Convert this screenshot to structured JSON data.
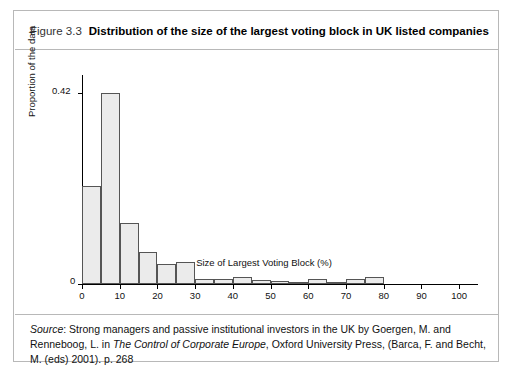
{
  "figure": {
    "number": "Figure 3.3",
    "title": "Distribution of the size of the largest voting block in UK listed companies"
  },
  "source": {
    "label": "Source",
    "line1_a": ": Strong managers and passive institutional investors in the UK by Goergen, M. and Renneboog, L. in",
    "line2_italic": "The Control of Corporate Europe",
    "line2_rest": ", Oxford University Press, (Barca, F. and Becht, M. (eds) 2001). p. 268"
  },
  "chart_data": {
    "type": "bar",
    "title": "Distribution of the size of the largest voting block in UK listed companies",
    "xlabel": "Size of Largest Voting Block (%)",
    "ylabel": "Proportion of the data",
    "xlim": [
      0,
      105
    ],
    "ylim": [
      0,
      0.46
    ],
    "grid": false,
    "legend": null,
    "xticks": [
      "0",
      "10",
      "20",
      "30",
      "40",
      "50",
      "60",
      "70",
      "80",
      "90",
      "100"
    ],
    "xtick_values": [
      0,
      10,
      20,
      30,
      40,
      50,
      60,
      70,
      80,
      90,
      100
    ],
    "yticks": [
      "0",
      "0.42"
    ],
    "ytick_values": [
      0,
      0.42
    ],
    "bin_width": 5,
    "bins": [
      {
        "x0": 0,
        "x1": 5,
        "value": 0.215
      },
      {
        "x0": 5,
        "x1": 10,
        "value": 0.42
      },
      {
        "x0": 10,
        "x1": 15,
        "value": 0.135
      },
      {
        "x0": 15,
        "x1": 20,
        "value": 0.07
      },
      {
        "x0": 20,
        "x1": 25,
        "value": 0.043
      },
      {
        "x0": 25,
        "x1": 30,
        "value": 0.048
      },
      {
        "x0": 30,
        "x1": 35,
        "value": 0.012
      },
      {
        "x0": 35,
        "x1": 40,
        "value": 0.012
      },
      {
        "x0": 40,
        "x1": 45,
        "value": 0.016
      },
      {
        "x0": 45,
        "x1": 50,
        "value": 0.008
      },
      {
        "x0": 50,
        "x1": 55,
        "value": 0.006
      },
      {
        "x0": 55,
        "x1": 60,
        "value": 0.004
      },
      {
        "x0": 60,
        "x1": 65,
        "value": 0.01
      },
      {
        "x0": 65,
        "x1": 70,
        "value": 0.004
      },
      {
        "x0": 70,
        "x1": 75,
        "value": 0.01
      },
      {
        "x0": 75,
        "x1": 80,
        "value": 0.016
      }
    ],
    "colors": {
      "bar_fill": "#ebebeb",
      "bar_edge": "#555555",
      "axis": "#000000"
    }
  }
}
